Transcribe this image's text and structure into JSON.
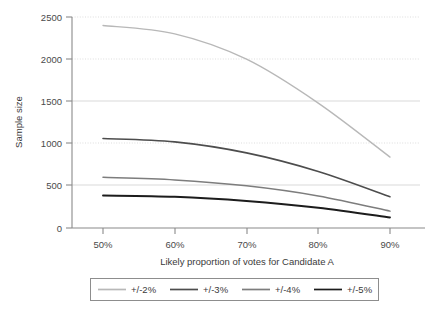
{
  "chart_data": {
    "type": "line",
    "title": "",
    "xlabel": "Likely proportion of votes for Candidate A",
    "ylabel": "Sample size",
    "x": [
      50,
      60,
      70,
      80,
      90
    ],
    "categories": [
      "50%",
      "60%",
      "70%",
      "80%",
      "90%"
    ],
    "xtick_labels": [
      "50%",
      "60%",
      "70%",
      "80%",
      "90%"
    ],
    "ytick_labels": [
      "0",
      "500",
      "1000",
      "1500",
      "2000",
      "2500"
    ],
    "ytick_values": [
      0,
      500,
      1000,
      1500,
      2000,
      2500
    ],
    "ylim": [
      0,
      2500
    ],
    "xlim": [
      45,
      95
    ],
    "grid": true,
    "legend_position": "bottom",
    "series": [
      {
        "name": "+/-2%",
        "color": "#b8b8b8",
        "width": 1.4,
        "values": [
          2400,
          2300,
          2000,
          1480,
          840
        ]
      },
      {
        "name": "+/-3%",
        "color": "#4d4d4d",
        "width": 1.6,
        "values": [
          1060,
          1020,
          890,
          670,
          370
        ]
      },
      {
        "name": "+/-4%",
        "color": "#7d7d7d",
        "width": 1.5,
        "values": [
          600,
          570,
          500,
          380,
          200
        ]
      },
      {
        "name": "+/-5%",
        "color": "#1c1c1c",
        "width": 1.9,
        "values": [
          385,
          370,
          320,
          240,
          125
        ]
      }
    ]
  },
  "legend": {
    "entries": [
      "+/-2%",
      "+/-3%",
      "+/-4%",
      "+/-5%"
    ]
  }
}
